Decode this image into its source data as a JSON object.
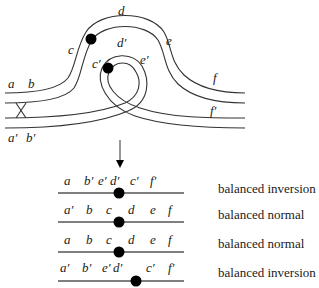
{
  "diagram": {
    "top_labels": {
      "a": "a",
      "b": "b",
      "c": "c",
      "d": "d",
      "e": "e",
      "f": "f",
      "a_prime": "a′",
      "b_prime": "b′",
      "c_prime": "c′",
      "d_prime": "d′",
      "e_prime": "e′",
      "f_prime": "f′"
    },
    "rows": [
      {
        "genes": [
          "a",
          "b′",
          "e′",
          "d′",
          "c′",
          "f′"
        ],
        "description": "balanced inversion"
      },
      {
        "genes": [
          "a′",
          "b",
          "c",
          "d",
          "e",
          "f"
        ],
        "description": "balanced normal"
      },
      {
        "genes": [
          "a",
          "b",
          "c",
          "d",
          "e",
          "f"
        ],
        "description": "balanced normal"
      },
      {
        "genes": [
          "a′",
          "b′",
          "e′",
          "d′",
          "c′",
          "f′"
        ],
        "description": "balanced inversion"
      }
    ]
  }
}
